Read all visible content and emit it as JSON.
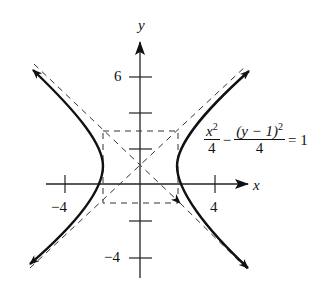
{
  "figure": {
    "type": "hyperbola graph",
    "axis_labels": {
      "x": "x",
      "y": "y"
    },
    "tick_labels": {
      "x_neg": "−4",
      "x_pos": "4",
      "y_pos": "6",
      "y_neg": "−4"
    },
    "equation": {
      "term1_num": "x",
      "term1_num_exp": "2",
      "term1_den": "4",
      "minus": "−",
      "term2_num": "(y − 1)",
      "term2_num_exp": "2",
      "term2_den": "4",
      "equals": "= 1"
    },
    "center": [
      0,
      1
    ],
    "vertices": [
      [
        -2,
        1
      ],
      [
        2,
        1
      ]
    ],
    "asymptotes": [
      "y = x + 1",
      "y = -x + 1"
    ],
    "reference_box": {
      "x": [
        -2,
        2
      ],
      "y": [
        -1,
        3
      ]
    },
    "x_ticks": [
      -4,
      4
    ],
    "y_ticks": [
      -4,
      -2,
      2,
      4,
      6
    ]
  }
}
